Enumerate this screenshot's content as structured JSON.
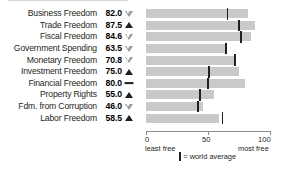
{
  "chart_data": {
    "type": "bar",
    "title": "",
    "xlabel": "",
    "ylabel": "",
    "xlim": [
      0,
      100
    ],
    "grid": false,
    "orientation": "horizontal",
    "categories": [
      "Business Freedom",
      "Trade Freedom",
      "Fiscal Freedom",
      "Government Spending",
      "Monetary Freedom",
      "Investment Freedom",
      "Financial Freedom",
      "Property Rights",
      "Fdm. from Corruption",
      "Labor Freedom"
    ],
    "values": [
      82.0,
      87.5,
      84.6,
      63.5,
      70.8,
      75.0,
      80.0,
      55.0,
      46.0,
      58.5
    ],
    "value_labels": [
      "82.0",
      "87.5",
      "84.6",
      "63.5",
      "70.8",
      "75.0",
      "80.0",
      "55.0",
      "46.0",
      "58.5"
    ],
    "trends": [
      "down",
      "up",
      "down",
      "down",
      "down",
      "up",
      "flat",
      "up",
      "down",
      "up"
    ],
    "world_average": [
      65.0,
      74.0,
      76.0,
      64.0,
      71.0,
      50.0,
      49.0,
      43.0,
      41.0,
      61.0
    ],
    "series": [
      {
        "name": "Country score",
        "values": [
          82.0,
          87.5,
          84.6,
          63.5,
          70.8,
          75.0,
          80.0,
          55.0,
          46.0,
          58.5
        ]
      },
      {
        "name": "world average",
        "values": [
          65.0,
          74.0,
          76.0,
          64.0,
          71.0,
          50.0,
          49.0,
          43.0,
          41.0,
          61.0
        ]
      }
    ],
    "xticks": [
      0,
      50,
      100
    ],
    "xtick_labels": [
      "0",
      "50",
      "100"
    ],
    "bar_color": "#c9c9c9",
    "marker_color": "#231f20"
  },
  "rows": [
    {
      "label": "Business Freedom",
      "value": "82.0",
      "num": 82.0,
      "trend": "down",
      "avg": 65.0
    },
    {
      "label": "Trade Freedom",
      "value": "87.5",
      "num": 87.5,
      "trend": "up",
      "avg": 74.0
    },
    {
      "label": "Fiscal Freedom",
      "value": "84.6",
      "num": 84.6,
      "trend": "down",
      "avg": 76.0
    },
    {
      "label": "Government Spending",
      "value": "63.5",
      "num": 63.5,
      "trend": "down",
      "avg": 64.0
    },
    {
      "label": "Monetary Freedom",
      "value": "70.8",
      "num": 70.8,
      "trend": "down",
      "avg": 71.0
    },
    {
      "label": "Investment Freedom",
      "value": "75.0",
      "num": 75.0,
      "trend": "up",
      "avg": 50.0
    },
    {
      "label": "Financial Freedom",
      "value": "80.0",
      "num": 80.0,
      "trend": "flat",
      "avg": 49.0
    },
    {
      "label": "Property Rights",
      "value": "55.0",
      "num": 55.0,
      "trend": "up",
      "avg": 43.0
    },
    {
      "label": "Fdm. from Corruption",
      "value": "46.0",
      "num": 46.0,
      "trend": "down",
      "avg": 41.0
    },
    {
      "label": "Labor Freedom",
      "value": "58.5",
      "num": 58.5,
      "trend": "up",
      "avg": 61.0
    }
  ],
  "axis": {
    "ticks": [
      {
        "value": 0,
        "label": "0",
        "caption": "least free"
      },
      {
        "value": 50,
        "label": "50",
        "caption": ""
      },
      {
        "value": 100,
        "label": "100",
        "caption": "most free"
      }
    ],
    "left_caption": "least free",
    "right_caption": "most free"
  },
  "legend": {
    "marker_label": "= world average"
  }
}
